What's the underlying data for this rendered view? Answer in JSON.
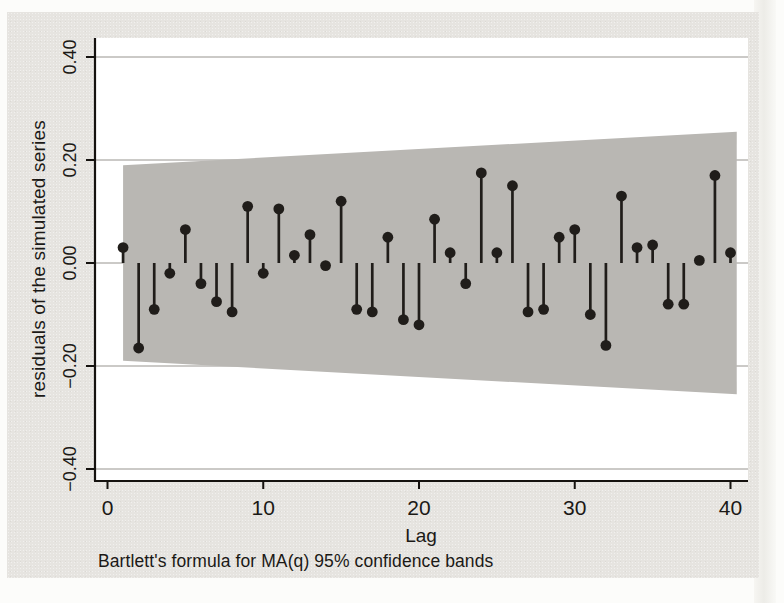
{
  "figure": {
    "caption": "Bartlett's formula for MA(q) 95% confidence bands",
    "xlabel": "Lag",
    "ylabel": "residuals of the simulated series"
  },
  "chart_data": {
    "type": "scatter",
    "variant": "stem-autocorrelogram",
    "title": "",
    "xlabel": "Lag",
    "ylabel": "residuals of the simulated series",
    "xlim": [
      -0.8,
      41.1
    ],
    "ylim": [
      -0.42,
      0.44
    ],
    "grid": "horizontal-only",
    "legend": "none",
    "note": "Bartlett's formula for MA(q) 95% confidence bands",
    "x": [
      1,
      2,
      3,
      4,
      5,
      6,
      7,
      8,
      9,
      10,
      11,
      12,
      13,
      14,
      15,
      16,
      17,
      18,
      19,
      20,
      21,
      22,
      23,
      24,
      25,
      26,
      27,
      28,
      29,
      30,
      31,
      32,
      33,
      34,
      35,
      36,
      37,
      38,
      39,
      40
    ],
    "values": [
      0.03,
      -0.165,
      -0.09,
      -0.02,
      0.065,
      -0.04,
      -0.075,
      -0.095,
      0.11,
      -0.02,
      0.105,
      0.015,
      0.055,
      -0.005,
      0.12,
      -0.09,
      -0.095,
      0.05,
      -0.11,
      -0.12,
      0.085,
      0.02,
      -0.04,
      0.175,
      0.02,
      0.15,
      -0.095,
      -0.09,
      0.05,
      0.065,
      -0.1,
      -0.16,
      0.13,
      0.03,
      0.035,
      -0.08,
      -0.08,
      0.005,
      0.17,
      0.02
    ],
    "yticks": [
      {
        "value": 0.4,
        "label": "0.40"
      },
      {
        "value": 0.2,
        "label": "0.20"
      },
      {
        "value": 0.0,
        "label": "0.00"
      },
      {
        "value": -0.2,
        "label": "−0.20"
      },
      {
        "value": -0.4,
        "label": "−0.40"
      }
    ],
    "xticks": [
      {
        "value": 0,
        "label": "0"
      },
      {
        "value": 10,
        "label": "10"
      },
      {
        "value": 20,
        "label": "20"
      },
      {
        "value": 30,
        "label": "30"
      },
      {
        "value": 40,
        "label": "40"
      }
    ],
    "confidence_band": {
      "kind": "Bartlett MA(q) 95%",
      "start_lag": 1,
      "end_lag": 40.4,
      "halfwidth_start": 0.19,
      "halfwidth_end": 0.255
    }
  },
  "colors": {
    "page_bg": "#fcfcfa",
    "card_bg": "#e6e4e0",
    "plot_bg": "#ffffff",
    "band_fill": "#b9b7b3",
    "stem_color": "#201d1a",
    "grid_color": "#97948f",
    "axis_color": "#15120f",
    "text_color": "#1b1916"
  }
}
